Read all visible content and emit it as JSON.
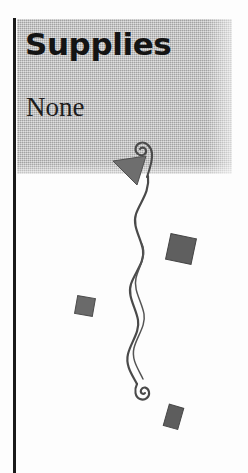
{
  "page": {
    "width": 248,
    "height": 473,
    "background_color": "#ffffff"
  },
  "sidebar": {
    "rule_color": "#1a1a1a",
    "panel": {
      "name": "supplies-panel",
      "background_color": "#b9b9b9",
      "title": "Supplies",
      "body": "None",
      "title_color": "#141414",
      "body_color": "#1d1d1d"
    }
  },
  "ornament": {
    "name": "decorative-flourish",
    "stroke_color": "#4a4a4a",
    "fill_color": "#6b6b6b",
    "elements": [
      {
        "name": "top-spiral",
        "type": "spiral",
        "x": 146,
        "y": 150
      },
      {
        "name": "arrow-triangle",
        "type": "triangle",
        "x": 130,
        "y": 166,
        "fill": "#6e6e6e"
      },
      {
        "name": "wavy-stem",
        "type": "curve"
      },
      {
        "name": "square-large",
        "type": "square",
        "x": 181,
        "y": 249,
        "size": 26,
        "rotation": 12,
        "fill": "#5f5f5f"
      },
      {
        "name": "square-small",
        "type": "square",
        "x": 85,
        "y": 306,
        "size": 18,
        "rotation": 10,
        "fill": "#6a6a6a"
      },
      {
        "name": "bottom-spiral",
        "type": "spiral",
        "x": 141,
        "y": 396
      },
      {
        "name": "rect-bottom",
        "type": "rect",
        "x": 174,
        "y": 417,
        "width": 15,
        "height": 22,
        "rotation": 16,
        "fill": "#5d5d5d"
      }
    ]
  }
}
